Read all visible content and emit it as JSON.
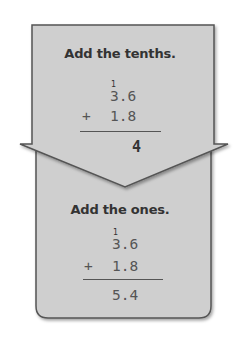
{
  "colors": {
    "panel_fill": "#cfcfcf",
    "panel_stroke": "#555555",
    "text_dark": "#333333",
    "digits": "#555555"
  },
  "step1": {
    "title": "Add the tenths.",
    "carry": "1",
    "addend1": "3.6",
    "operator": "+",
    "addend2": "1.8",
    "result": "4"
  },
  "step2": {
    "title": "Add the ones.",
    "carry": "1",
    "addend1": "3.6",
    "operator": "+",
    "addend2": "1.8",
    "result": "5.4"
  }
}
